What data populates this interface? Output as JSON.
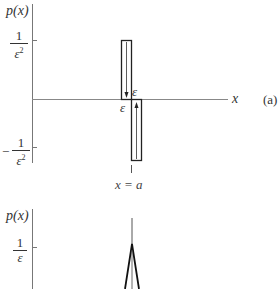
{
  "figure": {
    "panel_a": {
      "y_axis_label": "p(x)",
      "x_axis_label": "x",
      "panel_tag": "(a)",
      "top_tick": {
        "numerator": "1",
        "denominator": "ε",
        "power": "2",
        "sign": ""
      },
      "bottom_tick": {
        "numerator": "1",
        "denominator": "ε",
        "power": "2",
        "sign": "−"
      },
      "left_width_label": "ε",
      "right_width_label": "ε",
      "location_label": "x = a"
    },
    "panel_b": {
      "y_axis_label": "p(x)",
      "tick": {
        "numerator": "1",
        "denominator": "ε"
      }
    }
  },
  "colors": {
    "ink": "#333333",
    "axis": "#777777"
  }
}
